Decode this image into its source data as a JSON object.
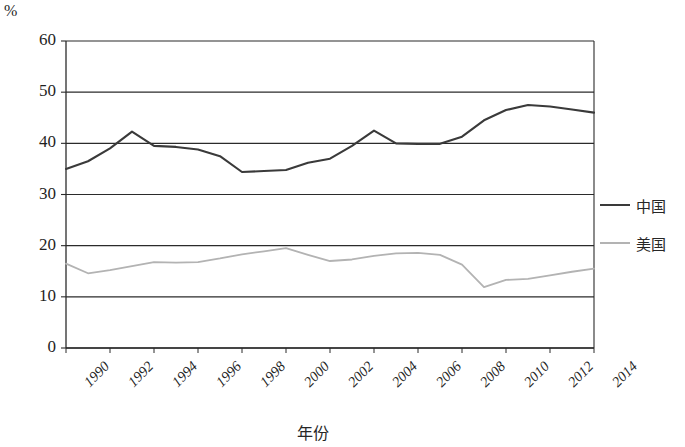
{
  "chart_data": {
    "type": "line",
    "title": "",
    "xlabel": "年份",
    "ylabel": "%",
    "unit_label": "%",
    "ylim": [
      0,
      60
    ],
    "yticks": [
      0,
      10,
      20,
      30,
      40,
      50,
      60
    ],
    "ytick_labels": [
      "0",
      "10",
      "20",
      "30",
      "40",
      "50",
      "60"
    ],
    "xlim": [
      1990,
      2014
    ],
    "xticks": [
      1990,
      1992,
      1994,
      1996,
      1998,
      2000,
      2002,
      2004,
      2006,
      2008,
      2010,
      2012,
      2014
    ],
    "xtick_labels": [
      "1990",
      "1992",
      "1994",
      "1996",
      "1998",
      "2000",
      "2002",
      "2004",
      "2006",
      "2008",
      "2010",
      "2012",
      "2014"
    ],
    "grid": true,
    "grid_axis": "y",
    "legend_position": "right",
    "x": [
      1990,
      1991,
      1992,
      1993,
      1994,
      1995,
      1996,
      1997,
      1998,
      1999,
      2000,
      2001,
      2002,
      2003,
      2004,
      2005,
      2006,
      2007,
      2008,
      2009,
      2010,
      2011,
      2012,
      2013,
      2014
    ],
    "series": [
      {
        "name": "中国",
        "color": "#3a3a3a",
        "values": [
          35.0,
          36.5,
          39.0,
          42.3,
          39.5,
          39.3,
          38.8,
          37.5,
          34.4,
          34.6,
          34.8,
          36.2,
          37.0,
          39.5,
          42.5,
          40.0,
          39.9,
          39.9,
          41.3,
          44.5,
          46.5,
          47.5,
          47.2,
          46.6,
          46.0
        ]
      },
      {
        "name": "美国",
        "color": "#b3b3b3",
        "values": [
          16.5,
          14.6,
          15.2,
          16.0,
          16.8,
          16.7,
          16.8,
          17.5,
          18.3,
          18.9,
          19.5,
          18.2,
          17.0,
          17.3,
          18.0,
          18.5,
          18.6,
          18.2,
          16.3,
          11.9,
          13.3,
          13.5,
          14.2,
          14.9,
          15.5
        ]
      }
    ]
  },
  "legend": {
    "items": [
      {
        "label": "中国"
      },
      {
        "label": "美国"
      }
    ]
  },
  "axes": {
    "y_unit": "%",
    "x_title": "年份"
  }
}
